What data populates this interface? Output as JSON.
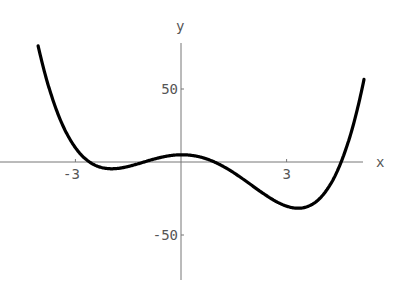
{
  "chart_data": {
    "type": "line",
    "title": "",
    "xlabel": "x",
    "ylabel": "y",
    "xlim": [
      -5.15,
      5.15
    ],
    "ylim": [
      -80,
      80
    ],
    "x_ticks": [
      {
        "value": -3,
        "label": "-3"
      },
      {
        "value": 3,
        "label": "3"
      }
    ],
    "y_ticks": [
      {
        "value": 50,
        "label": "50"
      },
      {
        "value": -50,
        "label": "-50"
      }
    ],
    "grid": false,
    "legend": null,
    "series": [
      {
        "name": "f(x)",
        "color": "#000000",
        "x": [
          -3.5,
          -3.0,
          -2.5,
          -2.0,
          -1.5,
          -1.0,
          -0.5,
          0.0,
          0.5,
          1.0,
          1.5,
          2.0,
          2.5,
          3.0,
          3.5,
          4.0,
          4.5,
          5.0
        ],
        "y": [
          80,
          30,
          0,
          -8,
          -6,
          0,
          6,
          8,
          6,
          -4,
          -20,
          -38,
          -56,
          -68,
          -70,
          -55,
          -10,
          80
        ]
      }
    ]
  },
  "axes": {
    "x_label": "x",
    "y_label": "y"
  }
}
